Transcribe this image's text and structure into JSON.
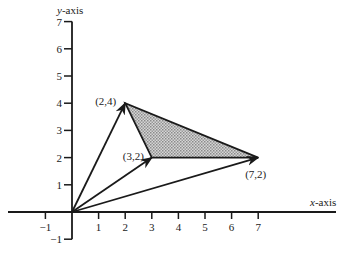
{
  "diagram": {
    "x_axis": {
      "label_var": "x",
      "label_rest": "-axis",
      "ticks": [
        "-1",
        "1",
        "2",
        "3",
        "4",
        "5",
        "6",
        "7"
      ],
      "tick_values": [
        -1,
        1,
        2,
        3,
        4,
        5,
        6,
        7
      ]
    },
    "y_axis": {
      "label_var": "y",
      "label_rest": "-axis",
      "ticks": [
        "-1",
        "1",
        "2",
        "3",
        "4",
        "5",
        "6",
        "7"
      ],
      "tick_values": [
        -1,
        1,
        2,
        3,
        4,
        5,
        6,
        7
      ]
    },
    "points": [
      {
        "label": "(2,4)",
        "x": 2,
        "y": 4
      },
      {
        "label": "(3,2)",
        "x": 3,
        "y": 2
      },
      {
        "label": "(7,2)",
        "x": 7,
        "y": 2
      }
    ],
    "vectors_from_origin": [
      [
        2,
        4
      ],
      [
        3,
        2
      ],
      [
        7,
        2
      ]
    ],
    "shaded_triangle": [
      [
        2,
        4
      ],
      [
        3,
        2
      ],
      [
        7,
        2
      ]
    ],
    "colors": {
      "line": "#1a1a1a",
      "fill": "#b8b8b8"
    }
  }
}
